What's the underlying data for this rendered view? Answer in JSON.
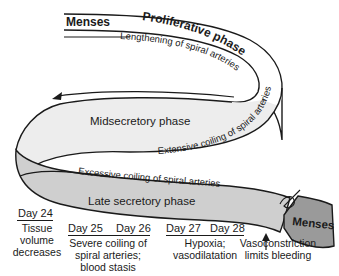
{
  "diagram": {
    "phases": {
      "menses_start": "Menses",
      "proliferative": "Proliferative phase",
      "midsecretory": "Midsecretory phase",
      "late_secretory": "Late secretory phase",
      "menses_end": "Menses"
    },
    "annotations": {
      "lengthening": "Lengthening of spiral arteries",
      "extensive": "Extensive coiling of spiral arteries",
      "excessive": "Excessive coiling of spiral arteries"
    },
    "timeline": {
      "day24": {
        "day": "Day 24",
        "lines": [
          "Tissue",
          "volume",
          "decreases"
        ]
      },
      "day25_26": {
        "days": [
          "Day 25",
          "Day 26"
        ],
        "lines": [
          "Severe coiling of",
          "spiral arteries;",
          "blood stasis"
        ]
      },
      "day27_28": {
        "days": [
          "Day 27",
          "Day 28"
        ],
        "lines": [
          "Hypoxia;",
          "vasodilatation"
        ]
      },
      "vasoconstriction": {
        "lines": [
          "Vasoconstriction",
          "limits bleeding"
        ]
      }
    },
    "colors": {
      "outline": "#1a1a1a",
      "ribbon_light": "#ededed",
      "ribbon_mid": "#cfcfcf",
      "menses_block": "#9a9a9a"
    }
  }
}
